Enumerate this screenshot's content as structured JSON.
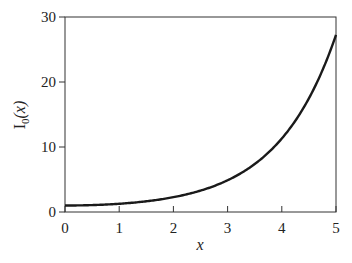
{
  "chart_data": {
    "type": "line",
    "title": "",
    "xlabel": "x",
    "ylabel_main": "I",
    "ylabel_sub": "0",
    "ylabel_arg": "(x)",
    "ylabel": "I0(x)",
    "xlim": [
      0,
      5
    ],
    "ylim": [
      0,
      30
    ],
    "xticks": [
      "0",
      "1",
      "2",
      "3",
      "4",
      "5"
    ],
    "yticks": [
      "0",
      "10",
      "20",
      "30"
    ],
    "grid": false,
    "legend": null,
    "series": [
      {
        "name": "I0(x)",
        "color": "#1a1a1a",
        "x": [
          0,
          0.5,
          1,
          1.5,
          2,
          2.5,
          3,
          3.5,
          4,
          4.5,
          5
        ],
        "values": [
          1.0,
          1.063,
          1.266,
          1.647,
          2.28,
          3.29,
          4.881,
          7.378,
          11.302,
          17.481,
          27.24
        ]
      }
    ]
  }
}
